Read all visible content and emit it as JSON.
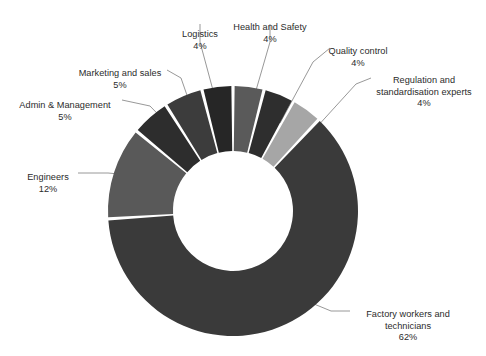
{
  "chart_data": {
    "type": "pie",
    "variant": "donut",
    "title": "",
    "subtitle": "",
    "xlabel": "",
    "ylabel": "",
    "legend_position": "none",
    "grid": false,
    "value_unit": "%",
    "start_angle_deg": 0,
    "direction": "clockwise",
    "categories": [
      "Health and Safety",
      "Quality control",
      "Regulation and standardisation experts",
      "Factory workers and technicians",
      "Engineers",
      "Admin & Management",
      "Marketing and sales",
      "Logistics"
    ],
    "values": [
      4,
      4,
      4,
      62,
      12,
      5,
      5,
      4
    ],
    "labels_text": [
      "Health and Safety",
      "Quality control",
      "Regulation and\nstandardisation experts",
      "Factory workers and\ntechnicians",
      "Engineers",
      "Admin & Management",
      "Marketing and sales",
      "Logistics"
    ],
    "value_labels": [
      "4%",
      "4%",
      "4%",
      "62%",
      "12%",
      "5%",
      "5%",
      "4%"
    ],
    "colors": [
      "#5a5a5a",
      "#2e2e2e",
      "#a6a6a6",
      "#3a3a3a",
      "#595959",
      "#2d2d2d",
      "#3c3c3c",
      "#262626"
    ],
    "slice_gap_color": "#ffffff",
    "background": "#ffffff",
    "leader_line_color": "#8c8c8c"
  },
  "slices": [
    {
      "name": "health-and-safety",
      "label": "Health and Safety",
      "pct_text": "4%",
      "value": 4,
      "color": "#5a5a5a"
    },
    {
      "name": "quality-control",
      "label": "Quality control",
      "pct_text": "4%",
      "value": 4,
      "color": "#2e2e2e"
    },
    {
      "name": "regulation",
      "label": "Regulation and\nstandardisation experts",
      "pct_text": "4%",
      "value": 4,
      "color": "#a6a6a6"
    },
    {
      "name": "factory-workers",
      "label": "Factory workers and\ntechnicians",
      "pct_text": "62%",
      "value": 62,
      "color": "#3a3a3a"
    },
    {
      "name": "engineers",
      "label": "Engineers",
      "pct_text": "12%",
      "value": 12,
      "color": "#595959"
    },
    {
      "name": "admin-management",
      "label": "Admin & Management",
      "pct_text": "5%",
      "value": 5,
      "color": "#2d2d2d"
    },
    {
      "name": "marketing-and-sales",
      "label": "Marketing and sales",
      "pct_text": "5%",
      "value": 5,
      "color": "#3c3c3c"
    },
    {
      "name": "logistics",
      "label": "Logistics",
      "pct_text": "4%",
      "value": 4,
      "color": "#262626"
    }
  ]
}
